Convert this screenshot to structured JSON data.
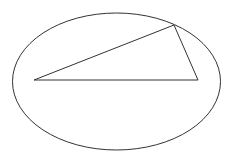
{
  "diagram": {
    "width": 230,
    "height": 156,
    "background": "#ffffff",
    "stroke_color": "#333333",
    "ellipse": {
      "cx": 116.5,
      "cy": 81.5,
      "rx": 104,
      "ry": 68.5,
      "stroke_width": 1
    },
    "triangle": {
      "points": [
        [
          34,
          80
        ],
        [
          174,
          25
        ],
        [
          198,
          80
        ]
      ],
      "stroke_width": 1
    }
  }
}
